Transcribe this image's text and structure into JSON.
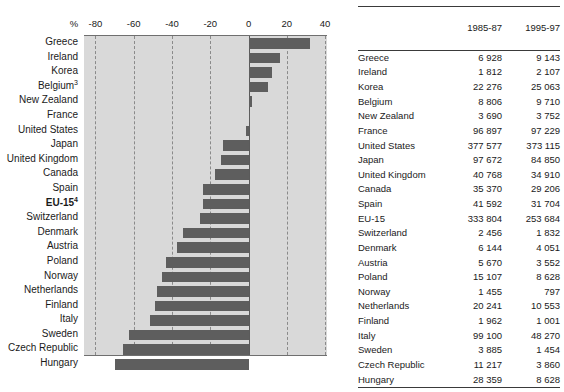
{
  "chart_data": {
    "type": "bar",
    "orientation": "horizontal",
    "title": "",
    "xlabel": "%",
    "ylabel": "",
    "xlim": [
      -86,
      41
    ],
    "ticks": [
      -80,
      -60,
      -40,
      -20,
      0,
      20,
      40
    ],
    "tick_labels": [
      "-80",
      "-60",
      "-40",
      "-20",
      "0",
      "20",
      "40"
    ],
    "grid": true,
    "grid_style": "dashed",
    "bar_color": "#5e5e5e",
    "plot_bg": "#d9d9d9",
    "categories": [
      "Greece",
      "Ireland",
      "Korea",
      "Belgium",
      "New Zealand",
      "France",
      "United States",
      "Japan",
      "United Kingdom",
      "Canada",
      "Spain",
      "EU-15",
      "Switzerland",
      "Denmark",
      "Austria",
      "Poland",
      "Norway",
      "Netherlands",
      "Finland",
      "Italy",
      "Sweden",
      "Czech Republic",
      "Hungary"
    ],
    "values": [
      32.0,
      16.3,
      12.5,
      10.3,
      1.7,
      0.3,
      -1.2,
      -13.1,
      -14.4,
      -17.4,
      -23.8,
      -24.0,
      -25.4,
      -34.1,
      -37.4,
      -42.9,
      -45.2,
      -47.9,
      -49.0,
      -51.3,
      -62.6,
      -65.6,
      -69.6
    ]
  },
  "chart": {
    "percent_symbol": "%",
    "labels": [
      {
        "name": "Greece",
        "sup": "",
        "bold": false
      },
      {
        "name": "Ireland",
        "sup": "",
        "bold": false
      },
      {
        "name": "Korea",
        "sup": "",
        "bold": false
      },
      {
        "name": "Belgium",
        "sup": "3",
        "bold": false
      },
      {
        "name": "New Zealand",
        "sup": "",
        "bold": false
      },
      {
        "name": "France",
        "sup": "",
        "bold": false
      },
      {
        "name": "United States",
        "sup": "",
        "bold": false
      },
      {
        "name": "Japan",
        "sup": "",
        "bold": false
      },
      {
        "name": "United Kingdom",
        "sup": "",
        "bold": false
      },
      {
        "name": "Canada",
        "sup": "",
        "bold": false
      },
      {
        "name": "Spain",
        "sup": "",
        "bold": false
      },
      {
        "name": "EU-15",
        "sup": "4",
        "bold": true
      },
      {
        "name": "Switzerland",
        "sup": "",
        "bold": false
      },
      {
        "name": "Denmark",
        "sup": "",
        "bold": false
      },
      {
        "name": "Austria",
        "sup": "",
        "bold": false
      },
      {
        "name": "Poland",
        "sup": "",
        "bold": false
      },
      {
        "name": "Norway",
        "sup": "",
        "bold": false
      },
      {
        "name": "Netherlands",
        "sup": "",
        "bold": false
      },
      {
        "name": "Finland",
        "sup": "",
        "bold": false
      },
      {
        "name": "Italy",
        "sup": "",
        "bold": false
      },
      {
        "name": "Sweden",
        "sup": "",
        "bold": false
      },
      {
        "name": "Czech Republic",
        "sup": "",
        "bold": false
      },
      {
        "name": "Hungary",
        "sup": "",
        "bold": false
      }
    ]
  },
  "table": {
    "headers": {
      "country": "",
      "period1": "1985-87",
      "period2": "1995-97"
    },
    "rows": [
      {
        "country": "Greece",
        "v1": "6 928",
        "v2": "9 143",
        "bold": false
      },
      {
        "country": "Ireland",
        "v1": "1 812",
        "v2": "2 107",
        "bold": false
      },
      {
        "country": "Korea",
        "v1": "22 276",
        "v2": "25 063",
        "bold": false
      },
      {
        "country": "Belgium",
        "v1": "8 806",
        "v2": "9 710",
        "bold": false
      },
      {
        "country": "New Zealand",
        "v1": "3 690",
        "v2": "3 752",
        "bold": false
      },
      {
        "country": "France",
        "v1": "96 897",
        "v2": "97 229",
        "bold": false
      },
      {
        "country": "United States",
        "v1": "377 577",
        "v2": "373 115",
        "bold": false
      },
      {
        "country": "Japan",
        "v1": "97 672",
        "v2": "84 850",
        "bold": false
      },
      {
        "country": "United Kingdom",
        "v1": "40 768",
        "v2": "34 910",
        "bold": false
      },
      {
        "country": "Canada",
        "v1": "35 370",
        "v2": "29 206",
        "bold": false
      },
      {
        "country": "Spain",
        "v1": "41 592",
        "v2": "31 704",
        "bold": false
      },
      {
        "country": "EU-15",
        "v1": "333 804",
        "v2": "253 684",
        "bold": true
      },
      {
        "country": "Switzerland",
        "v1": "2 456",
        "v2": "1 832",
        "bold": false
      },
      {
        "country": "Denmark",
        "v1": "6 144",
        "v2": "4 051",
        "bold": false
      },
      {
        "country": "Austria",
        "v1": "5 670",
        "v2": "3 552",
        "bold": false
      },
      {
        "country": "Poland",
        "v1": "15 107",
        "v2": "8 628",
        "bold": false
      },
      {
        "country": "Norway",
        "v1": "1 455",
        "v2": "797",
        "bold": false
      },
      {
        "country": "Netherlands",
        "v1": "20 241",
        "v2": "10 553",
        "bold": false
      },
      {
        "country": "Finland",
        "v1": "1 962",
        "v2": "1 001",
        "bold": false
      },
      {
        "country": "Italy",
        "v1": "99 100",
        "v2": "48 270",
        "bold": false
      },
      {
        "country": "Sweden",
        "v1": "3 885",
        "v2": "1 454",
        "bold": false
      },
      {
        "country": "Czech Republic",
        "v1": "11 217",
        "v2": "3 860",
        "bold": false
      },
      {
        "country": "Hungary",
        "v1": "28 359",
        "v2": "8 628",
        "bold": false
      }
    ]
  }
}
